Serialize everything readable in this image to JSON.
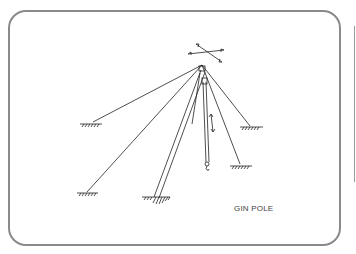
{
  "diagram": {
    "title": "GIN POLE",
    "elements": [
      "gin-pole-mast",
      "hoist-line-with-hook",
      "guy-lines",
      "ground-anchors",
      "movement-arrows"
    ],
    "colors": {
      "line": "#222222",
      "frame": "#8a8a8a",
      "text": "#444444"
    }
  }
}
